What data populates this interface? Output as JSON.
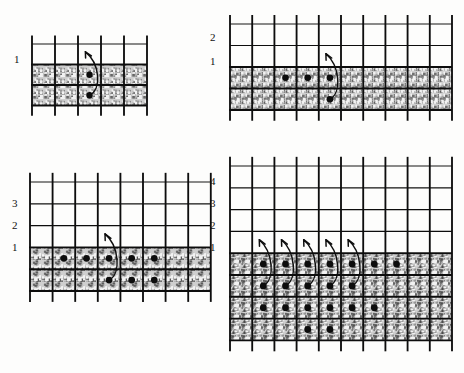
{
  "figure": {
    "title": "",
    "background_color": "#fdfdfc",
    "ink_color": "#111111",
    "shade_fill": "#b9b9b9",
    "dot_color": "#0d0d0d",
    "panel_count": 4
  },
  "panels": [
    {
      "id": "panel-top-left",
      "position": "top-left",
      "axis_labels": [
        "1"
      ],
      "columns": 5,
      "grid_rows_above": 1,
      "shaded_rows": 2,
      "dots": [
        {
          "row": 1,
          "col": 3
        },
        {
          "row": 2,
          "col": 3
        }
      ],
      "arrows": [
        {
          "from_row": 2,
          "from_col": 3,
          "to_row": 0,
          "to_col": 3
        }
      ],
      "arrow_count": 1,
      "dot_count": 2
    },
    {
      "id": "panel-top-right",
      "position": "top-right",
      "axis_labels": [
        "2",
        "1"
      ],
      "columns": 10,
      "grid_rows_above": 2,
      "shaded_rows": 2,
      "dots": [
        {
          "row": 1,
          "col": 3
        },
        {
          "row": 1,
          "col": 4
        },
        {
          "row": 1,
          "col": 5
        },
        {
          "row": 2,
          "col": 5
        }
      ],
      "arrows": [
        {
          "from_row": 2,
          "from_col": 5,
          "to_row": 0,
          "to_col": 5
        }
      ],
      "arrow_count": 1,
      "dot_count": 4
    },
    {
      "id": "panel-bottom-left",
      "position": "bottom-left",
      "axis_labels": [
        "3",
        "2",
        "1"
      ],
      "columns": 8,
      "grid_rows_above": 3,
      "shaded_rows": 2,
      "dots": [
        {
          "row": 1,
          "col": 2
        },
        {
          "row": 1,
          "col": 3
        },
        {
          "row": 1,
          "col": 4
        },
        {
          "row": 1,
          "col": 5
        },
        {
          "row": 1,
          "col": 6
        },
        {
          "row": 2,
          "col": 4
        },
        {
          "row": 2,
          "col": 5
        },
        {
          "row": 2,
          "col": 6
        }
      ],
      "arrows": [
        {
          "from_row": 2,
          "from_col": 4,
          "to_row": 0,
          "to_col": 4
        }
      ],
      "arrow_count": 1,
      "dot_count": 8
    },
    {
      "id": "panel-bottom-right",
      "position": "bottom-right",
      "axis_labels": [
        "4",
        "3",
        "2",
        "1"
      ],
      "columns": 10,
      "grid_rows_above": 4,
      "shaded_rows": 4,
      "dots": [
        {
          "row": 1,
          "col": 2
        },
        {
          "row": 1,
          "col": 3
        },
        {
          "row": 1,
          "col": 4
        },
        {
          "row": 1,
          "col": 5
        },
        {
          "row": 1,
          "col": 6
        },
        {
          "row": 1,
          "col": 7
        },
        {
          "row": 1,
          "col": 8
        },
        {
          "row": 2,
          "col": 2
        },
        {
          "row": 2,
          "col": 3
        },
        {
          "row": 2,
          "col": 4
        },
        {
          "row": 2,
          "col": 5
        },
        {
          "row": 2,
          "col": 6
        },
        {
          "row": 3,
          "col": 2
        },
        {
          "row": 3,
          "col": 3
        },
        {
          "row": 3,
          "col": 4
        },
        {
          "row": 3,
          "col": 5
        },
        {
          "row": 3,
          "col": 6
        },
        {
          "row": 3,
          "col": 7
        },
        {
          "row": 4,
          "col": 4
        },
        {
          "row": 4,
          "col": 5
        }
      ],
      "arrows": [
        {
          "from_row": 2,
          "from_col": 2,
          "to_row": 0,
          "to_col": 2
        },
        {
          "from_row": 2,
          "from_col": 3,
          "to_row": 0,
          "to_col": 3
        },
        {
          "from_row": 2,
          "from_col": 4,
          "to_row": 0,
          "to_col": 4
        },
        {
          "from_row": 2,
          "from_col": 5,
          "to_row": 0,
          "to_col": 5
        },
        {
          "from_row": 2,
          "from_col": 6,
          "to_row": 0,
          "to_col": 6
        }
      ],
      "arrow_count": 5,
      "dot_count": 20
    }
  ]
}
